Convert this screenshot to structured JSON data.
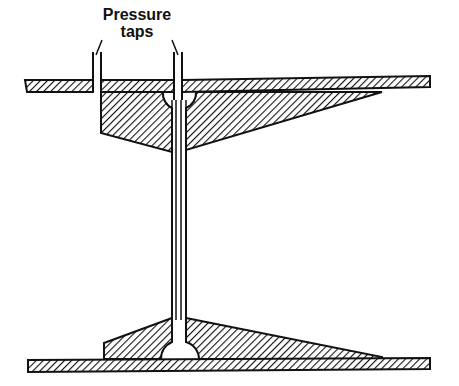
{
  "figure": {
    "labels": {
      "line1": "Pressure",
      "line2": "taps"
    },
    "components": {
      "upper_wall": "pipe-wall-top",
      "lower_wall": "pipe-wall-bottom",
      "upper_nozzle": "flow-nozzle-upper-half",
      "lower_nozzle": "flow-nozzle-lower-half",
      "pressure_tap_upstream": "tap-left",
      "pressure_tap_downstream": "tap-right",
      "throat_tube": "center-tube"
    },
    "colors": {
      "ink": "#111111",
      "background": "#ffffff"
    }
  }
}
